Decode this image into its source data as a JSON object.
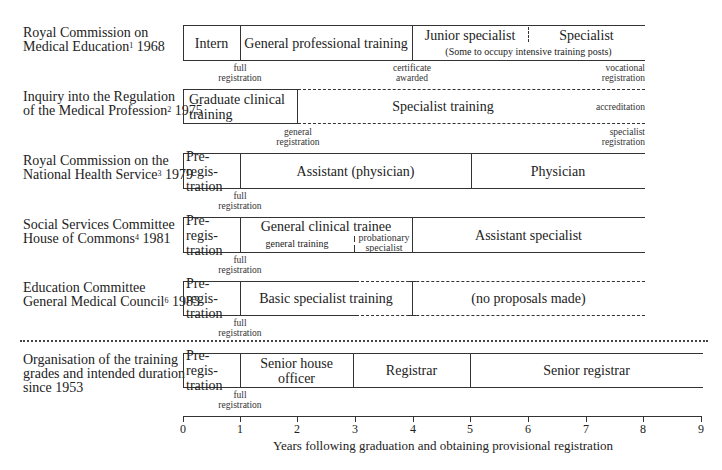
{
  "rows": [
    {
      "label_line1": "Royal Commission on",
      "label_line2": "Medical Education",
      "footnote": "1",
      "year": " 1968",
      "segments": [
        {
          "text": "Intern",
          "start": 0,
          "end": 1
        },
        {
          "text": "General professional training",
          "start": 1,
          "end": 4
        },
        {
          "text": "Junior specialist",
          "start": 4,
          "end": 6
        },
        {
          "text": "Specialist",
          "start": 6,
          "end": 8
        }
      ],
      "subnote": "(Some to occupy intensive training posts)",
      "annotations": [
        {
          "line1": "full",
          "line2": "registration",
          "at": 1
        },
        {
          "line1": "certificate",
          "line2": "awarded",
          "at": 4
        },
        {
          "line1": "vocational",
          "line2": "registration",
          "at": 8
        }
      ]
    },
    {
      "label_line1": "Inquiry into the Regulation",
      "label_line2": "of the Medical Profession",
      "footnote": "2",
      "year": " 1975",
      "segments": [
        {
          "text_line1": "Graduate clinical",
          "text_line2": "training",
          "start": 0,
          "end": 2
        },
        {
          "text": "Specialist training",
          "start": 2,
          "end": 8,
          "style": "dashed"
        }
      ],
      "inline_note": "accreditation",
      "annotations": [
        {
          "line1": "general",
          "line2": "registration",
          "at": 2
        },
        {
          "line1": "specialist",
          "line2": "registration",
          "at": 8
        }
      ]
    },
    {
      "label_line1": "Royal Commission on the",
      "label_line2": "National Health Service",
      "footnote": "3",
      "year": " 1979",
      "segments": [
        {
          "text_line1": "Pre-regis-",
          "text_line2": "tration",
          "start": 0,
          "end": 1
        },
        {
          "text": "Assistant (physician)",
          "start": 1,
          "end": 5
        },
        {
          "text": "Physician",
          "start": 5,
          "end": 8
        }
      ],
      "annotations": [
        {
          "line1": "full",
          "line2": "registration",
          "at": 1
        }
      ]
    },
    {
      "label_line1": "Social Services Committee",
      "label_line2": "House of Commons",
      "footnote": "4",
      "year": " 1981",
      "segments": [
        {
          "text_line1": "Pre-regis-",
          "text_line2": "tration",
          "start": 0,
          "end": 1
        },
        {
          "text": "General clinical trainee",
          "start": 1,
          "end": 4
        },
        {
          "text": "Assistant specialist",
          "start": 4,
          "end": 8
        }
      ],
      "sub_segments": [
        {
          "text": "general training",
          "start": 1,
          "end": 3
        },
        {
          "text_line1": "probationary",
          "text_line2": "specialist",
          "start": 3,
          "end": 4
        }
      ],
      "annotations": [
        {
          "line1": "full",
          "line2": "registration",
          "at": 1
        }
      ]
    },
    {
      "label_line1": "Education Committee",
      "label_line2": "General Medical Council",
      "footnote": "6",
      "year": " 1983",
      "segments": [
        {
          "text_line1": "Pre-regis-",
          "text_line2": "tration",
          "start": 0,
          "end": 1
        },
        {
          "text": "Basic specialist training",
          "start": 1,
          "end": 4
        },
        {
          "text": "(no proposals made)",
          "start": 4,
          "end": 8,
          "style": "dashed"
        }
      ],
      "annotations": [
        {
          "line1": "full",
          "line2": "registration",
          "at": 1
        }
      ]
    },
    {
      "label_line1": "Organisation of the training",
      "label_line2": "grades and intended duration",
      "label_line3": "since 1953",
      "segments": [
        {
          "text_line1": "Pre-regis-",
          "text_line2": "tration",
          "start": 0,
          "end": 1
        },
        {
          "text": "Senior house officer",
          "start": 1,
          "end": 3
        },
        {
          "text": "Registrar",
          "start": 3,
          "end": 5
        },
        {
          "text": "Senior registrar",
          "start": 5,
          "end": 9
        }
      ],
      "annotations": [
        {
          "line1": "full",
          "line2": "registration",
          "at": 1
        }
      ]
    }
  ],
  "axis": {
    "ticks": [
      "0",
      "1",
      "2",
      "3",
      "4",
      "5",
      "6",
      "7",
      "8",
      "9"
    ],
    "label": "Years following graduation and obtaining provisional registration"
  }
}
